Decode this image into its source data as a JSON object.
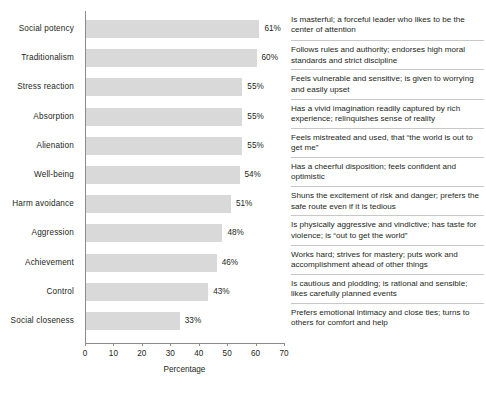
{
  "chart_data": {
    "type": "bar",
    "orientation": "horizontal",
    "title": "",
    "xlabel": "Percentage",
    "ylabel": "",
    "xlim": [
      0,
      70
    ],
    "xticks": [
      0,
      10,
      20,
      30,
      40,
      50,
      60,
      70
    ],
    "grid": false,
    "legend": null,
    "bar_color": "#d9d9d9",
    "categories": [
      "Social potency",
      "Traditionalism",
      "Stress reaction",
      "Absorption",
      "Alienation",
      "Well-being",
      "Harm avoidance",
      "Aggression",
      "Achievement",
      "Control",
      "Social closeness"
    ],
    "values": [
      61,
      60,
      55,
      55,
      55,
      54,
      51,
      48,
      46,
      43,
      33
    ],
    "value_labels": [
      "61%",
      "60%",
      "55%",
      "55%",
      "55%",
      "54%",
      "51%",
      "48%",
      "46%",
      "43%",
      "33%"
    ],
    "descriptions": [
      "Is masterful; a forceful leader who likes to be the center of attention",
      "Follows rules and authority; endorses high moral standards and strict discipline",
      "Feels vulnerable and sensitive; is given to worrying and easily upset",
      "Has a vivid imagination readily captured by rich experience; relinquishes sense of reality",
      "Feels mistreated and used, that “the world is out to get me”",
      "Has a cheerful disposition; feels confident and optimistic",
      "Shuns the excitement of risk and danger; prefers the safe route even if it is tedious",
      "Is physically aggressive and vindictive; has taste for violence; is “out to get the world”",
      "Works hard; strives for mastery; puts work and accomplishment ahead of other things",
      "Is cautious and plodding; is rational and sensible; likes carefully planned events",
      "Prefers emotional intimacy and close ties; turns to others for comfort and help"
    ]
  }
}
